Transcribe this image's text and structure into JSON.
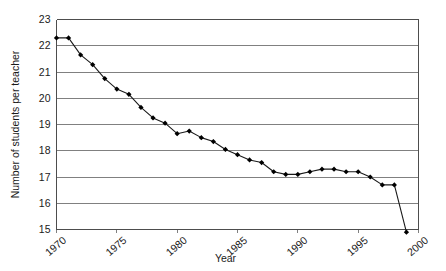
{
  "chart_data": {
    "type": "line",
    "title": "",
    "xlabel": "Year",
    "ylabel": "Number of students per teacher",
    "xlim": [
      1970,
      2000
    ],
    "ylim": [
      15,
      23
    ],
    "grid": true,
    "legend": null,
    "xticks": [
      1970,
      1975,
      1980,
      1985,
      1990,
      1995,
      2000
    ],
    "xtick_labels": [
      "1970",
      "1975",
      "1980",
      "1985",
      "1990",
      "1995",
      "2000"
    ],
    "yticks": [
      15,
      16,
      17,
      18,
      19,
      20,
      21,
      22,
      23
    ],
    "ytick_labels": [
      "15",
      "16",
      "17",
      "18",
      "19",
      "20",
      "21",
      "22",
      "23"
    ],
    "marker": "filled-diamond",
    "line_color": "#1a1a1a",
    "marker_color": "#000000",
    "grid_color": "#808080",
    "x": [
      1970,
      1971,
      1972,
      1973,
      1974,
      1975,
      1976,
      1977,
      1978,
      1979,
      1980,
      1981,
      1982,
      1983,
      1984,
      1985,
      1986,
      1987,
      1988,
      1989,
      1990,
      1991,
      1992,
      1993,
      1994,
      1995,
      1996,
      1997,
      1998,
      1999
    ],
    "values": [
      22.3,
      22.3,
      21.65,
      21.28,
      20.75,
      20.35,
      20.15,
      19.65,
      19.25,
      19.05,
      18.65,
      18.75,
      18.5,
      18.35,
      18.05,
      17.85,
      17.65,
      17.55,
      17.2,
      17.1,
      17.1,
      17.2,
      17.3,
      17.3,
      17.2,
      17.2,
      17.0,
      16.7,
      16.7,
      14.9
    ],
    "series": [
      {
        "name": "Students per teacher",
        "values": [
          22.3,
          22.3,
          21.65,
          21.28,
          20.75,
          20.35,
          20.15,
          19.65,
          19.25,
          19.05,
          18.65,
          18.75,
          18.5,
          18.35,
          18.05,
          17.85,
          17.65,
          17.55,
          17.2,
          17.1,
          17.1,
          17.2,
          17.3,
          17.3,
          17.2,
          17.2,
          17.0,
          16.7,
          16.7,
          14.9
        ]
      }
    ]
  }
}
